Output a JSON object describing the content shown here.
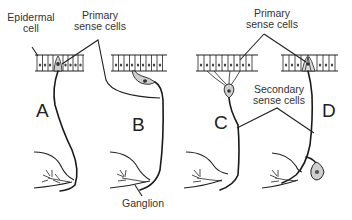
{
  "figure": {
    "type": "diagram",
    "labels": {
      "epidermal_cell": "Epidermal\ncell",
      "primary_sense_cells_top_left": "Primary\nsense cells",
      "primary_sense_cells_top_right": "Primary\nsense cells",
      "secondary_sense_cells": "Secondary\nsense cells",
      "ganglion": "Ganglion"
    },
    "panels": [
      {
        "id": "A",
        "letter": "A"
      },
      {
        "id": "B",
        "letter": "B"
      },
      {
        "id": "C",
        "letter": "C"
      },
      {
        "id": "D",
        "letter": "D"
      }
    ],
    "colors": {
      "ink": "#222222",
      "cell_fill": "#cfcfcf",
      "background": "#ffffff"
    }
  }
}
